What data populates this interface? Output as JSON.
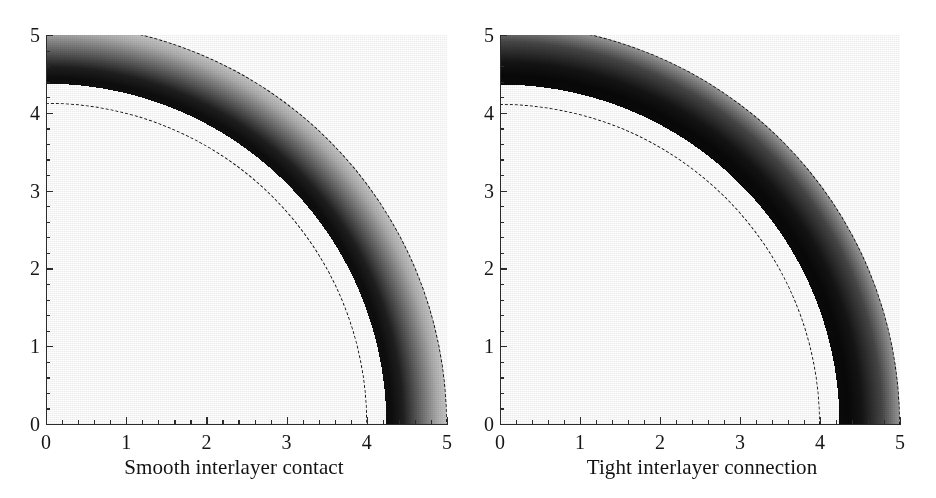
{
  "figure": {
    "type": "two-panel grayscale contour density plot",
    "background": "#ffffff",
    "ink_color": "#161616"
  },
  "chart_data": [
    {
      "type": "heatmap",
      "title": "Smooth interlayer contact",
      "panel": "left",
      "xlabel": "",
      "ylabel": "",
      "xlim": [
        0,
        5
      ],
      "ylim": [
        0,
        5
      ],
      "xticks": [
        0,
        1,
        2,
        3,
        4,
        5
      ],
      "yticks": [
        0,
        1,
        2,
        3,
        4,
        5
      ],
      "xtick_labels": [
        "0",
        "1",
        "2",
        "3",
        "4",
        "5"
      ],
      "ytick_labels": [
        "0",
        "1",
        "2",
        "3",
        "4",
        "5"
      ],
      "minor_tick_step": 0.2,
      "grid": false,
      "legend": "none",
      "geometry": "quarter annulus, inner radius 3, outer radius 5, centred at origin",
      "annotations": [
        {
          "kind": "dashed-arc",
          "radius": 4,
          "style": "dashed",
          "color": "#111111"
        },
        {
          "kind": "dashed-arc",
          "radius": 5,
          "style": "dashed",
          "color": "#111111"
        }
      ],
      "colormap": "grayscale",
      "radial_profile": {
        "r": [
          3.0,
          3.05,
          3.15,
          3.3,
          3.45,
          3.6,
          3.72,
          3.85,
          4.0,
          4.15,
          4.35,
          4.55,
          4.7,
          4.82,
          4.92,
          5.0
        ],
        "gray_level": [
          0.06,
          0.05,
          0.12,
          0.4,
          0.68,
          0.86,
          0.96,
          0.93,
          0.84,
          0.74,
          0.67,
          0.6,
          0.48,
          0.26,
          0.12,
          0.07
        ]
      }
    },
    {
      "type": "heatmap",
      "title": "Tight interlayer connection",
      "panel": "right",
      "xlabel": "",
      "ylabel": "",
      "xlim": [
        0,
        5
      ],
      "ylim": [
        0,
        5
      ],
      "xticks": [
        0,
        1,
        2,
        3,
        4,
        5
      ],
      "yticks": [
        0,
        1,
        2,
        3,
        4,
        5
      ],
      "xtick_labels": [
        "0",
        "1",
        "2",
        "3",
        "4",
        "5"
      ],
      "ytick_labels": [
        "0",
        "1",
        "2",
        "3",
        "4",
        "5"
      ],
      "minor_tick_step": 0.2,
      "grid": false,
      "legend": "none",
      "geometry": "quarter annulus, inner radius 3, outer radius 5, centred at origin",
      "annotations": [
        {
          "kind": "dashed-arc",
          "radius": 4,
          "style": "dashed",
          "color": "#111111"
        },
        {
          "kind": "dashed-arc",
          "radius": 5,
          "style": "dashed",
          "color": "#111111"
        }
      ],
      "colormap": "grayscale",
      "radial_profile": {
        "r": [
          3.0,
          3.08,
          3.2,
          3.38,
          3.52,
          3.64,
          3.76,
          3.88,
          4.0,
          4.18,
          4.38,
          4.56,
          4.7,
          4.84,
          4.93,
          5.0
        ],
        "gray_level": [
          0.04,
          0.03,
          0.08,
          0.28,
          0.58,
          0.82,
          0.95,
          0.91,
          0.8,
          0.71,
          0.64,
          0.56,
          0.4,
          0.18,
          0.08,
          0.05
        ]
      }
    }
  ],
  "panels": [
    {
      "id": "smooth-interlayer-contact",
      "caption": "Smooth interlayer contact",
      "y_axis": {
        "labels": [
          "0",
          "1",
          "2",
          "3",
          "4",
          "5"
        ],
        "values": [
          0,
          1,
          2,
          3,
          4,
          5
        ]
      },
      "x_axis": {
        "labels": [
          "0",
          "1",
          "2",
          "3",
          "4",
          "5"
        ],
        "values": [
          0,
          1,
          2,
          3,
          4,
          5
        ]
      }
    },
    {
      "id": "tight-interlayer-connection",
      "caption": "Tight interlayer connection",
      "y_axis": {
        "labels": [
          "0",
          "1",
          "2",
          "3",
          "4",
          "5"
        ],
        "values": [
          0,
          1,
          2,
          3,
          4,
          5
        ]
      },
      "x_axis": {
        "labels": [
          "0",
          "1",
          "2",
          "3",
          "4",
          "5"
        ],
        "values": [
          0,
          1,
          2,
          3,
          4,
          5
        ]
      }
    }
  ]
}
